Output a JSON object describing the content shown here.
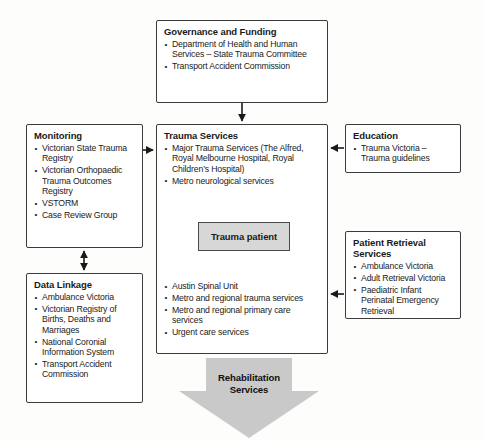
{
  "diagram": {
    "colors": {
      "box_border": "#3b3b3b",
      "box_fill": "#ffffff",
      "patient_fill": "#d7d7d7",
      "arrow_fill": "#c9c9c9",
      "text": "#1a1a1a"
    }
  },
  "boxes": {
    "governance": {
      "title": "Governance and Funding",
      "items": [
        "Department of Health and Human Services –  State Trauma Committee",
        "Transport Accident Commission"
      ]
    },
    "monitoring": {
      "title": "Monitoring",
      "items": [
        "Victorian State Trauma Registry",
        "Victorian Orthopaedic Trauma Outcomes Registry",
        "VSTORM",
        "Case Review Group"
      ]
    },
    "trauma_services": {
      "title": "Trauma Services",
      "items_top": [
        "Major Trauma Services (The Alfred, Royal Melbourne Hospital, Royal Children’s Hospital)",
        "Metro neurological services"
      ],
      "items_bottom": [
        "Austin Spinal Unit",
        "Metro and regional trauma services",
        "Metro and regional primary care services",
        "Urgent care services"
      ],
      "patient_label": "Trauma patient"
    },
    "education": {
      "title": "Education",
      "items": [
        "Trauma Victoria – Trauma guidelines"
      ]
    },
    "data_linkage": {
      "title": "Data Linkage",
      "items": [
        "Ambulance Victoria",
        "Victorian Registry of Births, Deaths and Marriages",
        "National Coronial Information System",
        "Transport Accident Commission"
      ]
    },
    "patient_retrieval": {
      "title": "Patient Retrieval Services",
      "items": [
        "Ambulance Victoria",
        "Adult Retrieval Victoria",
        "Paediatric Infant Perinatal Emergency Retrieval"
      ]
    },
    "rehabilitation": {
      "label_line1": "Rehabilitation",
      "label_line2": "Services"
    }
  },
  "connectors": [
    {
      "name": "governance-to-trauma",
      "from": "governance",
      "to": "trauma_services",
      "direction": "down"
    },
    {
      "name": "monitoring-to-trauma",
      "from": "monitoring",
      "to": "trauma_services",
      "direction": "right"
    },
    {
      "name": "monitoring-datalinkage",
      "from": "monitoring",
      "to": "data_linkage",
      "direction": "both"
    },
    {
      "name": "education-to-trauma",
      "from": "education",
      "to": "trauma_services",
      "direction": "left"
    },
    {
      "name": "retrieval-to-trauma",
      "from": "patient_retrieval",
      "to": "trauma_services",
      "direction": "left"
    }
  ]
}
